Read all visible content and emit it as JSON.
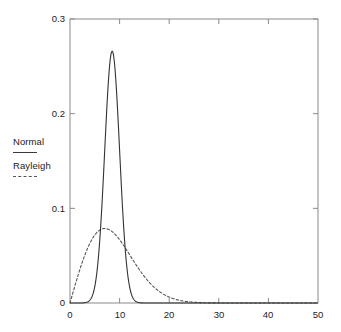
{
  "chart_data": {
    "type": "line",
    "title": "",
    "xlabel": "",
    "ylabel": "",
    "xlim": [
      0,
      50
    ],
    "ylim": [
      0,
      0.3
    ],
    "grid": false,
    "legend_position": "left-outside",
    "x_ticks": [
      "0",
      "10",
      "20",
      "30",
      "40",
      "50"
    ],
    "x_tick_values": [
      0,
      10,
      20,
      30,
      40,
      50
    ],
    "y_ticks": [
      "0",
      "0.1",
      "0.2",
      "0.3"
    ],
    "y_tick_values": [
      0,
      0.1,
      0.2,
      0.3
    ],
    "series": [
      {
        "name": "Normal",
        "style": "solid",
        "color": "#333333",
        "distribution": "normal",
        "mean": 8.5,
        "sigma": 1.5,
        "peak_x": 8.5,
        "peak_y": 0.266,
        "x": [
          0,
          1,
          2,
          3,
          4,
          5,
          5.5,
          6,
          6.5,
          7,
          7.5,
          8,
          8.5,
          9,
          9.5,
          10,
          10.5,
          11,
          11.5,
          12,
          13,
          14,
          15,
          16,
          18,
          20,
          25,
          30,
          35,
          40,
          45,
          50
        ],
        "values": [
          0.0,
          0.0,
          0.0,
          0.0,
          0.0008,
          0.0076,
          0.0195,
          0.0425,
          0.0796,
          0.1093,
          0.164,
          0.213,
          0.266,
          0.213,
          0.164,
          0.1093,
          0.0796,
          0.0425,
          0.0195,
          0.0076,
          0.0008,
          0.0001,
          0.0,
          0.0,
          0.0,
          0.0,
          0.0,
          0.0,
          0.0,
          0.0,
          0.0,
          0.0
        ]
      },
      {
        "name": "Rayleigh",
        "style": "dashed",
        "color": "#555555",
        "distribution": "rayleigh",
        "sigma": 7.0,
        "peak_x": 7.0,
        "peak_y": 0.0787,
        "x": [
          0,
          1,
          2,
          3,
          4,
          5,
          6,
          7,
          8,
          9,
          10,
          12,
          14,
          16,
          18,
          20,
          22,
          24,
          26,
          28,
          30,
          32,
          35,
          40,
          45,
          50
        ],
        "values": [
          0.0,
          0.02,
          0.0388,
          0.0554,
          0.0689,
          0.0784,
          0.0838,
          0.0787,
          0.0775,
          0.0733,
          0.0678,
          0.0531,
          0.0382,
          0.0252,
          0.0153,
          0.0085,
          0.0043,
          0.002,
          0.0009,
          0.0003,
          0.0001,
          4e-05,
          0.0,
          0.0,
          0.0,
          0.0
        ]
      }
    ]
  },
  "legend": {
    "entries": [
      {
        "label": "Normal",
        "style": "solid"
      },
      {
        "label": "Rayleigh",
        "style": "dashed"
      }
    ]
  },
  "axes": {
    "y_labels": [
      "0.3",
      "0.2",
      "0.1",
      "0"
    ],
    "x_labels": [
      "0",
      "10",
      "20",
      "30",
      "40",
      "50"
    ]
  }
}
